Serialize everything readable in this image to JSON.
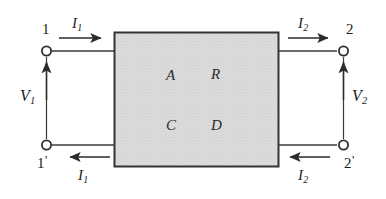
{
  "figure": {
    "kind": "two-port-network-diagram",
    "background_color": "#ffffff",
    "line_color": "#3a3a3a",
    "text_color": "#1c1c1c"
  },
  "network_box": {
    "name": "two-port-network-box",
    "fill_color": "#dcdcdc",
    "border_color": "#333333",
    "parameters": [
      {
        "id": "A",
        "label": "A",
        "position": "top-left"
      },
      {
        "id": "B",
        "label": "R",
        "position": "top-right"
      },
      {
        "id": "C",
        "label": "C",
        "position": "bottom-left"
      },
      {
        "id": "D",
        "label": "D",
        "position": "bottom-right"
      }
    ]
  },
  "terminals": [
    {
      "id": "t1",
      "label": "1",
      "prime": "",
      "side": "left",
      "row": "top"
    },
    {
      "id": "t1p",
      "label": "1",
      "prime": "'",
      "side": "left",
      "row": "bottom"
    },
    {
      "id": "t2",
      "label": "2",
      "prime": "",
      "side": "right",
      "row": "top"
    },
    {
      "id": "t2p",
      "label": "2",
      "prime": "'",
      "side": "right",
      "row": "bottom"
    }
  ],
  "currents": [
    {
      "id": "i1-top",
      "symbol": "I",
      "subscript": "1",
      "direction": "right",
      "side": "left",
      "row": "top"
    },
    {
      "id": "i1-bottom",
      "symbol": "I",
      "subscript": "1",
      "direction": "left",
      "side": "left",
      "row": "bottom"
    },
    {
      "id": "i2-top",
      "symbol": "I",
      "subscript": "2",
      "direction": "right",
      "side": "right",
      "row": "top"
    },
    {
      "id": "i2-bottom",
      "symbol": "I",
      "subscript": "2",
      "direction": "left",
      "side": "right",
      "row": "bottom"
    }
  ],
  "voltages": [
    {
      "id": "v1",
      "symbol": "V",
      "subscript": "1",
      "direction": "up",
      "side": "left"
    },
    {
      "id": "v2",
      "symbol": "V",
      "subscript": "2",
      "direction": "up",
      "side": "right"
    }
  ]
}
